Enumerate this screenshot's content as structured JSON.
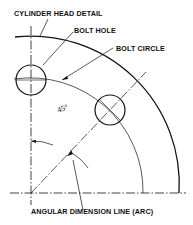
{
  "diagram": {
    "title": "CYLINDER HEAD DETAIL",
    "labels": {
      "cylinder_head": "CYLINDER HEAD DETAIL",
      "bolt_hole": "BOLT HOLE",
      "bolt_circle": "BOLT CIRCLE",
      "angular_dimension": "ANGULAR DIMENSION LINE (ARC)",
      "angle": "45°"
    },
    "geometry": {
      "center": [
        31,
        193
      ],
      "outer_radius": 148,
      "bolt_circle_radius": 112,
      "bolt_hole_radius": 15,
      "dimension_arc_radius": 52,
      "angle_deg": 45
    },
    "colors": {
      "line": "#111111",
      "background": "#ffffff"
    }
  }
}
